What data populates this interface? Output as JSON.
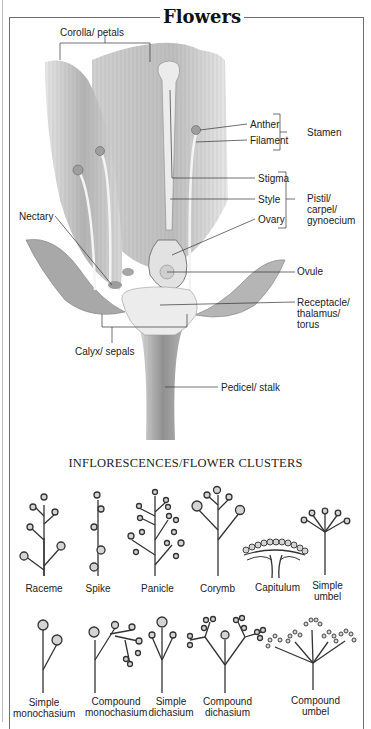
{
  "title": "Flowers",
  "flower_diagram": {
    "labels": {
      "corolla": "Corolla/ petals",
      "anther": "Anther",
      "filament": "Filament",
      "stamen": "Stamen",
      "stigma": "Stigma",
      "style": "Style",
      "ovary": "Ovary",
      "pistil_1": "Pistil/",
      "pistil_2": "carpel/",
      "pistil_3": "gynoecium",
      "nectary": "Nectary",
      "ovule": "Ovule",
      "receptacle_1": "Receptacle/",
      "receptacle_2": "thalamus/",
      "receptacle_3": "torus",
      "calyx": "Calyx/ sepals",
      "pedicel": "Pedicel/ stalk"
    }
  },
  "inflorescences": {
    "heading": "INFLORESCENCES/FLOWER CLUSTERS",
    "row1": [
      {
        "line1": "Raceme",
        "line2": ""
      },
      {
        "line1": "Spike",
        "line2": ""
      },
      {
        "line1": "Panicle",
        "line2": ""
      },
      {
        "line1": "Corymb",
        "line2": ""
      },
      {
        "line1": "Capitulum",
        "line2": ""
      },
      {
        "line1": "Simple",
        "line2": "umbel"
      }
    ],
    "row2": [
      {
        "line1": "Simple",
        "line2": "monochasium"
      },
      {
        "line1": "Compound",
        "line2": "monochasium"
      },
      {
        "line1": "Simple",
        "line2": "dichasium"
      },
      {
        "line1": "Compound",
        "line2": "dichasium"
      },
      {
        "line1": "Compound",
        "line2": "umbel"
      }
    ]
  },
  "colors": {
    "petal": "#b9b9b9",
    "line": "#333333",
    "frame": "#6e6e6e",
    "flowerhead": "#d4d4d4"
  }
}
